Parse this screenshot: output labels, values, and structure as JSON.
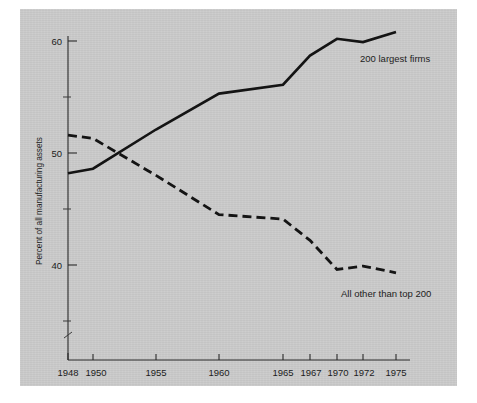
{
  "figure": {
    "background_color": "#c9c9c9",
    "page_color": "#ffffff",
    "ink_color": "#141414"
  },
  "axes": {
    "y_title": "Percent of all manufacturing assets",
    "y_ticks": [
      "60",
      "50",
      "40"
    ],
    "x_ticks": [
      "1948",
      "1950",
      "1955",
      "1960",
      "1965",
      "1967",
      "1970",
      "1972",
      "1975"
    ]
  },
  "labels": {
    "solid_series": "200 largest firms",
    "dashed_series": "All other than top 200"
  },
  "chart_data": {
    "type": "line",
    "title": "",
    "subtitle": "",
    "xlabel": "",
    "ylabel": "Percent of all manufacturing assets",
    "xlim": [
      1948,
      1975
    ],
    "ylim": [
      35,
      62
    ],
    "grid": false,
    "legend_position": "inline-annotations",
    "x_tick_labels": [
      "1948",
      "1950",
      "1955",
      "1960",
      "1965",
      "1967",
      "1970",
      "1972",
      "1975"
    ],
    "y_tick_labels": [
      "40",
      "50",
      "60"
    ],
    "y_minor_ticks": [
      35,
      45,
      55
    ],
    "x": [
      1948,
      1950,
      1955,
      1960,
      1965,
      1967,
      1970,
      1972,
      1975
    ],
    "series": [
      {
        "name": "200 largest firms",
        "style": "solid",
        "values": [
          48.2,
          48.6,
          52.1,
          55.3,
          56.1,
          58.7,
          60.2,
          59.9,
          60.8
        ]
      },
      {
        "name": "All other than top 200",
        "style": "dashed",
        "values": [
          51.6,
          51.3,
          48.0,
          44.5,
          44.1,
          42.2,
          39.6,
          39.9,
          39.3
        ]
      }
    ],
    "annotations": [
      {
        "text": "200 largest firms",
        "near_x": 1972,
        "near_y": 58.0
      },
      {
        "text": "All other than top 200",
        "near_x": 1972,
        "near_y": 37.0
      }
    ]
  }
}
